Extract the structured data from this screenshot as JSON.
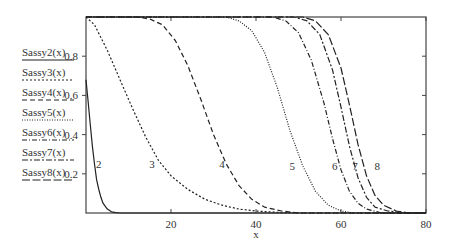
{
  "chart_data": {
    "type": "line",
    "title": "",
    "xlabel": "x",
    "ylabel": "",
    "xlim": [
      0,
      80
    ],
    "ylim": [
      0,
      1
    ],
    "xticks": [
      20,
      40,
      60,
      80
    ],
    "xtick_labels": [
      "20",
      "40",
      "60",
      "80"
    ],
    "yticks": [
      0.2,
      0.4,
      0.6,
      0.8
    ],
    "ytick_labels": [
      "0.2",
      "0.4",
      "0.6",
      "0.8"
    ],
    "grid": false,
    "legend_position": "left-outside",
    "series": [
      {
        "name": "Sassy2(x)",
        "label": "2",
        "style": "solid",
        "dash": "",
        "label_pos": [
          3,
          0.25
        ],
        "points": [
          [
            0,
            0.68
          ],
          [
            0.5,
            0.57
          ],
          [
            1,
            0.45
          ],
          [
            1.5,
            0.34
          ],
          [
            2,
            0.25
          ],
          [
            2.5,
            0.17
          ],
          [
            3,
            0.12
          ],
          [
            3.5,
            0.08
          ],
          [
            4,
            0.05
          ],
          [
            5,
            0.02
          ],
          [
            6,
            0.006
          ],
          [
            7,
            0.002
          ],
          [
            8,
            0
          ],
          [
            80,
            0
          ]
        ]
      },
      {
        "name": "Sassy3(x)",
        "label": "3",
        "style": "dotted-short",
        "dash": "2,2",
        "label_pos": [
          15.5,
          0.25
        ],
        "points": [
          [
            0,
            1
          ],
          [
            2,
            0.96
          ],
          [
            5,
            0.83
          ],
          [
            8,
            0.68
          ],
          [
            11,
            0.53
          ],
          [
            14,
            0.39
          ],
          [
            17,
            0.27
          ],
          [
            20,
            0.19
          ],
          [
            24,
            0.12
          ],
          [
            28,
            0.07
          ],
          [
            32,
            0.04
          ],
          [
            36,
            0.02
          ],
          [
            40,
            0.01
          ],
          [
            45,
            0.003
          ],
          [
            50,
            0
          ],
          [
            80,
            0
          ]
        ]
      },
      {
        "name": "Sassy4(x)",
        "label": "4",
        "style": "dashed",
        "dash": "5,3",
        "label_pos": [
          32,
          0.25
        ],
        "points": [
          [
            0,
            1
          ],
          [
            12,
            1
          ],
          [
            15,
            0.99
          ],
          [
            18,
            0.96
          ],
          [
            21,
            0.88
          ],
          [
            24,
            0.75
          ],
          [
            27,
            0.58
          ],
          [
            30,
            0.4
          ],
          [
            33,
            0.25
          ],
          [
            36,
            0.14
          ],
          [
            39,
            0.07
          ],
          [
            42,
            0.03
          ],
          [
            46,
            0.01
          ],
          [
            50,
            0
          ],
          [
            80,
            0
          ]
        ]
      },
      {
        "name": "Sassy5(x)",
        "label": "5",
        "style": "dotted",
        "dash": "1,1.5",
        "label_pos": [
          48.5,
          0.24
        ],
        "points": [
          [
            0,
            1
          ],
          [
            33,
            1
          ],
          [
            36,
            0.98
          ],
          [
            39,
            0.93
          ],
          [
            42,
            0.82
          ],
          [
            45,
            0.64
          ],
          [
            48,
            0.42
          ],
          [
            51,
            0.24
          ],
          [
            54,
            0.11
          ],
          [
            57,
            0.04
          ],
          [
            60,
            0.01
          ],
          [
            63,
            0
          ],
          [
            80,
            0
          ]
        ]
      },
      {
        "name": "Sassy6(x)",
        "label": "6",
        "style": "dash-dot",
        "dash": "5,2,1,2",
        "label_pos": [
          58.5,
          0.24
        ],
        "points": [
          [
            0,
            1
          ],
          [
            44,
            1
          ],
          [
            47,
            0.98
          ],
          [
            50,
            0.92
          ],
          [
            53,
            0.78
          ],
          [
            56,
            0.56
          ],
          [
            58,
            0.38
          ],
          [
            60,
            0.22
          ],
          [
            62,
            0.11
          ],
          [
            64,
            0.05
          ],
          [
            66,
            0.02
          ],
          [
            69,
            0.003
          ],
          [
            72,
            0
          ],
          [
            80,
            0
          ]
        ]
      },
      {
        "name": "Sassy7(x)",
        "label": "7",
        "style": "dash-dash-dot",
        "dash": "6,2,2,2",
        "label_pos": [
          63.3,
          0.24
        ],
        "points": [
          [
            0,
            1
          ],
          [
            49,
            1
          ],
          [
            52,
            0.98
          ],
          [
            55,
            0.91
          ],
          [
            58,
            0.73
          ],
          [
            60,
            0.54
          ],
          [
            62,
            0.34
          ],
          [
            64,
            0.18
          ],
          [
            66,
            0.08
          ],
          [
            68,
            0.03
          ],
          [
            71,
            0.01
          ],
          [
            75,
            0
          ],
          [
            80,
            0
          ]
        ]
      },
      {
        "name": "Sassy8(x)",
        "label": "8",
        "style": "long-dash",
        "dash": "8,2.5",
        "label_pos": [
          68.5,
          0.24
        ],
        "points": [
          [
            0,
            1
          ],
          [
            51,
            1
          ],
          [
            54,
            0.98
          ],
          [
            57,
            0.91
          ],
          [
            60,
            0.74
          ],
          [
            62,
            0.55
          ],
          [
            64,
            0.35
          ],
          [
            66,
            0.19
          ],
          [
            68,
            0.09
          ],
          [
            70,
            0.04
          ],
          [
            73,
            0.01
          ],
          [
            76,
            0
          ],
          [
            80,
            0
          ]
        ]
      }
    ]
  },
  "legend": {
    "items": [
      {
        "label": "Sassy2(x)"
      },
      {
        "label": "Sassy3(x)"
      },
      {
        "label": "Sassy4(x)"
      },
      {
        "label": "Sassy5(x)"
      },
      {
        "label": "Sassy6(x)"
      },
      {
        "label": "Sassy7(x)"
      },
      {
        "label": "Sassy8(x)"
      }
    ]
  },
  "colors": {
    "line": "#222222",
    "axis": "#444444",
    "text": "#333333"
  }
}
